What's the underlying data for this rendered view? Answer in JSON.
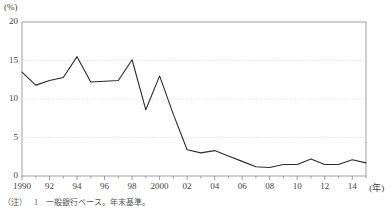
{
  "chart_data": {
    "type": "line",
    "title": "",
    "xlabel": "年",
    "ylabel": "(%)",
    "unit_label": "(%)",
    "ylim": [
      0,
      20
    ],
    "xlim": [
      1990,
      2015
    ],
    "grid": true,
    "legend": "none",
    "y_ticks": [
      "0",
      "5",
      "10",
      "15",
      "20"
    ],
    "y_tick_values": [
      0,
      5,
      10,
      15,
      20
    ],
    "x_ticks": [
      "1990",
      "92",
      "94",
      "96",
      "98",
      "2000",
      "02",
      "04",
      "06",
      "08",
      "10",
      "12",
      "14"
    ],
    "x_tick_values": [
      1990,
      1992,
      1994,
      1996,
      1998,
      2000,
      2002,
      2004,
      2006,
      2008,
      2010,
      2012,
      2014
    ],
    "x_axis_unit": "(年)",
    "series": [
      {
        "name": "比率",
        "x": [
          1990,
          1991,
          1992,
          1993,
          1994,
          1995,
          1996,
          1997,
          1998,
          1999,
          2000,
          2001,
          2002,
          2003,
          2004,
          2005,
          2006,
          2007,
          2008,
          2009,
          2010,
          2011,
          2012,
          2013,
          2014,
          2015
        ],
        "values": [
          13.5,
          11.8,
          12.4,
          12.8,
          15.5,
          12.2,
          12.3,
          12.4,
          15.1,
          8.6,
          13.0,
          8.0,
          3.4,
          3.0,
          3.3,
          2.6,
          1.9,
          1.2,
          1.1,
          1.5,
          1.5,
          2.2,
          1.5,
          1.5,
          2.1,
          1.7
        ],
        "color": "#2b2b2b"
      }
    ],
    "line_color": "#2b2b2b",
    "grid_color": "#d8d8d8",
    "axis_color": "#888888"
  },
  "note": {
    "tag": "（注）",
    "number": "1",
    "text": "一般銀行ベース。年末基準。"
  }
}
